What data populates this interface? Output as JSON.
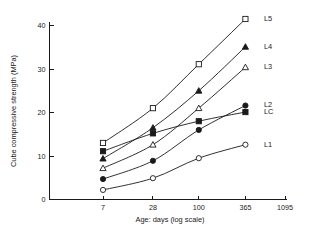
{
  "chart_data": {
    "type": "line",
    "title": "",
    "xlabel": "Age: days (log scale)",
    "ylabel": "Cube compressive strength (MPa)",
    "x_scale": "log",
    "x": [
      7,
      28,
      100,
      365
    ],
    "x_ticks": [
      7,
      28,
      100,
      365,
      1095
    ],
    "x_tick_labels": [
      "7",
      "28",
      "100",
      "365",
      "1095"
    ],
    "xlim": [
      7,
      1095
    ],
    "y_ticks": [
      0,
      10,
      20,
      30,
      40
    ],
    "y_tick_labels": [
      "0",
      "10",
      "20",
      "30",
      "40"
    ],
    "ylim": [
      0,
      43
    ],
    "grid": false,
    "legend_position": "right-inline",
    "series": [
      {
        "name": "L5",
        "label": "L5",
        "marker": "open-square",
        "values": [
          13.0,
          21.0,
          31.1,
          41.5
        ]
      },
      {
        "name": "L4",
        "label": "L4",
        "marker": "filled-triangle",
        "values": [
          9.4,
          16.5,
          25.0,
          35.1
        ]
      },
      {
        "name": "L3",
        "label": "L3",
        "marker": "open-triangle",
        "values": [
          7.2,
          12.6,
          21.0,
          30.4
        ]
      },
      {
        "name": "L2",
        "label": "L2",
        "marker": "filled-circle",
        "values": [
          4.7,
          8.9,
          16.0,
          21.6
        ]
      },
      {
        "name": "LC",
        "label": "LC",
        "marker": "filled-square",
        "values": [
          11.1,
          15.2,
          18.0,
          20.1
        ]
      },
      {
        "name": "L1",
        "label": "L1",
        "marker": "open-circle",
        "values": [
          2.2,
          4.9,
          9.5,
          12.6
        ]
      }
    ]
  }
}
